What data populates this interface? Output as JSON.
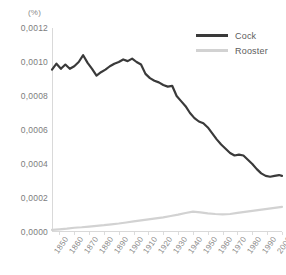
{
  "chart_data": {
    "type": "line",
    "title": "",
    "xlabel": "",
    "ylabel": "(%)",
    "unit_label": "(%)",
    "grid": false,
    "legend_position": "top-right",
    "xlim": [
      1845,
      2000
    ],
    "ylim": [
      0.0,
      0.0012
    ],
    "ytick_labels": [
      "0,0012",
      "0,0010",
      "0,0008",
      "0,0006",
      "0,0004",
      "0,0002",
      "0,0000"
    ],
    "ytick_values": [
      0.0012,
      0.001,
      0.0008,
      0.0006,
      0.0004,
      0.0002,
      0.0
    ],
    "xtick_labels": [
      "1850",
      "1860",
      "1870",
      "1880",
      "1890",
      "1900",
      "1910",
      "1920",
      "1930",
      "1940",
      "1950",
      "1960",
      "1970",
      "1980",
      "1990",
      "2000"
    ],
    "xtick_values": [
      1850,
      1860,
      1870,
      1880,
      1890,
      1900,
      1910,
      1920,
      1930,
      1940,
      1950,
      1960,
      1970,
      1980,
      1990,
      2000
    ],
    "series": [
      {
        "name": "Cock",
        "color": "#3a3a3a",
        "x": [
          1845,
          1848,
          1851,
          1854,
          1857,
          1860,
          1863,
          1866,
          1869,
          1872,
          1875,
          1878,
          1881,
          1884,
          1887,
          1890,
          1893,
          1896,
          1899,
          1902,
          1905,
          1908,
          1911,
          1914,
          1917,
          1920,
          1923,
          1926,
          1929,
          1932,
          1935,
          1938,
          1941,
          1944,
          1947,
          1950,
          1953,
          1956,
          1959,
          1962,
          1965,
          1968,
          1971,
          1974,
          1977,
          1980,
          1983,
          1986,
          1989,
          1992,
          1995,
          1998,
          2000
        ],
        "values": [
          0.000955,
          0.00099,
          0.00096,
          0.000985,
          0.00096,
          0.000975,
          0.001,
          0.00104,
          0.000995,
          0.00096,
          0.00092,
          0.00094,
          0.000955,
          0.000975,
          0.00099,
          0.001,
          0.001015,
          0.001005,
          0.00102,
          0.001,
          0.000985,
          0.00093,
          0.000905,
          0.00089,
          0.00088,
          0.000865,
          0.000855,
          0.00086,
          0.0008,
          0.00077,
          0.00074,
          0.0007,
          0.00067,
          0.00065,
          0.00064,
          0.000615,
          0.00058,
          0.000545,
          0.000515,
          0.00049,
          0.000465,
          0.00045,
          0.000455,
          0.00045,
          0.000425,
          0.0004,
          0.00037,
          0.000345,
          0.00033,
          0.000325,
          0.00033,
          0.000335,
          0.00033
        ]
      },
      {
        "name": "Rooster",
        "color": "#d2d2d2",
        "x": [
          1845,
          1850,
          1855,
          1860,
          1865,
          1870,
          1875,
          1880,
          1885,
          1890,
          1895,
          1900,
          1905,
          1910,
          1915,
          1920,
          1925,
          1930,
          1935,
          1940,
          1945,
          1950,
          1955,
          1960,
          1965,
          1970,
          1975,
          1980,
          1985,
          1990,
          1995,
          2000
        ],
        "values": [
          1.2e-05,
          1.6e-05,
          2e-05,
          2.5e-05,
          2.8e-05,
          3.2e-05,
          3.6e-05,
          4e-05,
          4.5e-05,
          5e-05,
          5.6e-05,
          6.2e-05,
          6.8e-05,
          7.4e-05,
          8e-05,
          8.6e-05,
          9.4e-05,
          0.000102,
          0.000112,
          0.00012,
          0.000115,
          0.00011,
          0.000106,
          0.000104,
          0.000106,
          0.000112,
          0.000118,
          0.000124,
          0.00013,
          0.000136,
          0.000142,
          0.000148
        ]
      }
    ]
  },
  "legend": {
    "items": [
      {
        "label": "Cock",
        "color": "#3a3a3a"
      },
      {
        "label": "Rooster",
        "color": "#d2d2d2"
      }
    ]
  }
}
